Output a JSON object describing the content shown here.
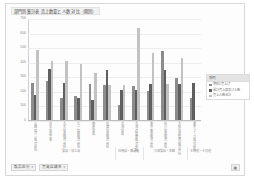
{
  "chart": {
    "title": "部門別集計表 売上数量と人数 対比（期別）"
  },
  "legend": {
    "title": "系列",
    "items": [
      {
        "label": "期別1売上げ",
        "color": "#8c8c8c",
        "marker": "legend-swatch-series-1"
      },
      {
        "label": "累計売上高及び人数",
        "color": "#5e5e5e",
        "marker": "legend-swatch-series-2"
      },
      {
        "label": "売上人数合計",
        "color": "#c2c2c2",
        "marker": "legend-swatch-series-3"
      }
    ]
  },
  "field_buttons": [
    {
      "label": "製品区分",
      "caret": "▾"
    },
    {
      "label": "売買店舗名",
      "caret": "▾"
    }
  ],
  "corner_control": {
    "label": "▦"
  },
  "chart_data": {
    "type": "bar",
    "title": "部門別集計表 売上数量と人数 対比（期別）",
    "xlabel": "",
    "ylabel": "",
    "ylim": [
      0,
      700
    ],
    "yticks": [
      0,
      100,
      200,
      300,
      400,
      500,
      600,
      700
    ],
    "grid": true,
    "legend_position": "right",
    "categories": [
      "山崎製パン株式会社",
      "日本食品工業",
      "丸大食品株式会社",
      "丸一製粉株式会社",
      "明星食品",
      "日清食品株式会社",
      "北海食品",
      "北海道製菓株式会社",
      "東京青果株式会社",
      "石川食品株式会社",
      "大阪食品製造株式会社",
      "東京フーズ株式会社"
    ],
    "groups": [
      {
        "label": "食品・加工品",
        "span": 6
      },
      {
        "label": "日用品・雑貨類",
        "span": 2
      },
      {
        "label": "冷凍食品・生鮮",
        "span": 3
      },
      {
        "label": "その他・その他",
        "span": 2
      }
    ],
    "series": [
      {
        "name": "期別1売上げ",
        "color": "#8c8c8c",
        "values": [
          255,
          268,
          153,
          168,
          246,
          237,
          104,
          234,
          202,
          473,
          290,
          152
        ]
      },
      {
        "name": "累計売上高及び人数",
        "color": "#5e5e5e",
        "values": [
          172,
          347,
          252,
          150,
          136,
          345,
          206,
          206,
          250,
          340,
          248,
          253
        ]
      },
      {
        "name": "売上人数合計",
        "color": "#c2c2c2",
        "values": [
          482,
          404,
          408,
          387,
          322,
          240,
          243,
          630,
          460,
          250,
          425,
          0
        ]
      }
    ]
  }
}
